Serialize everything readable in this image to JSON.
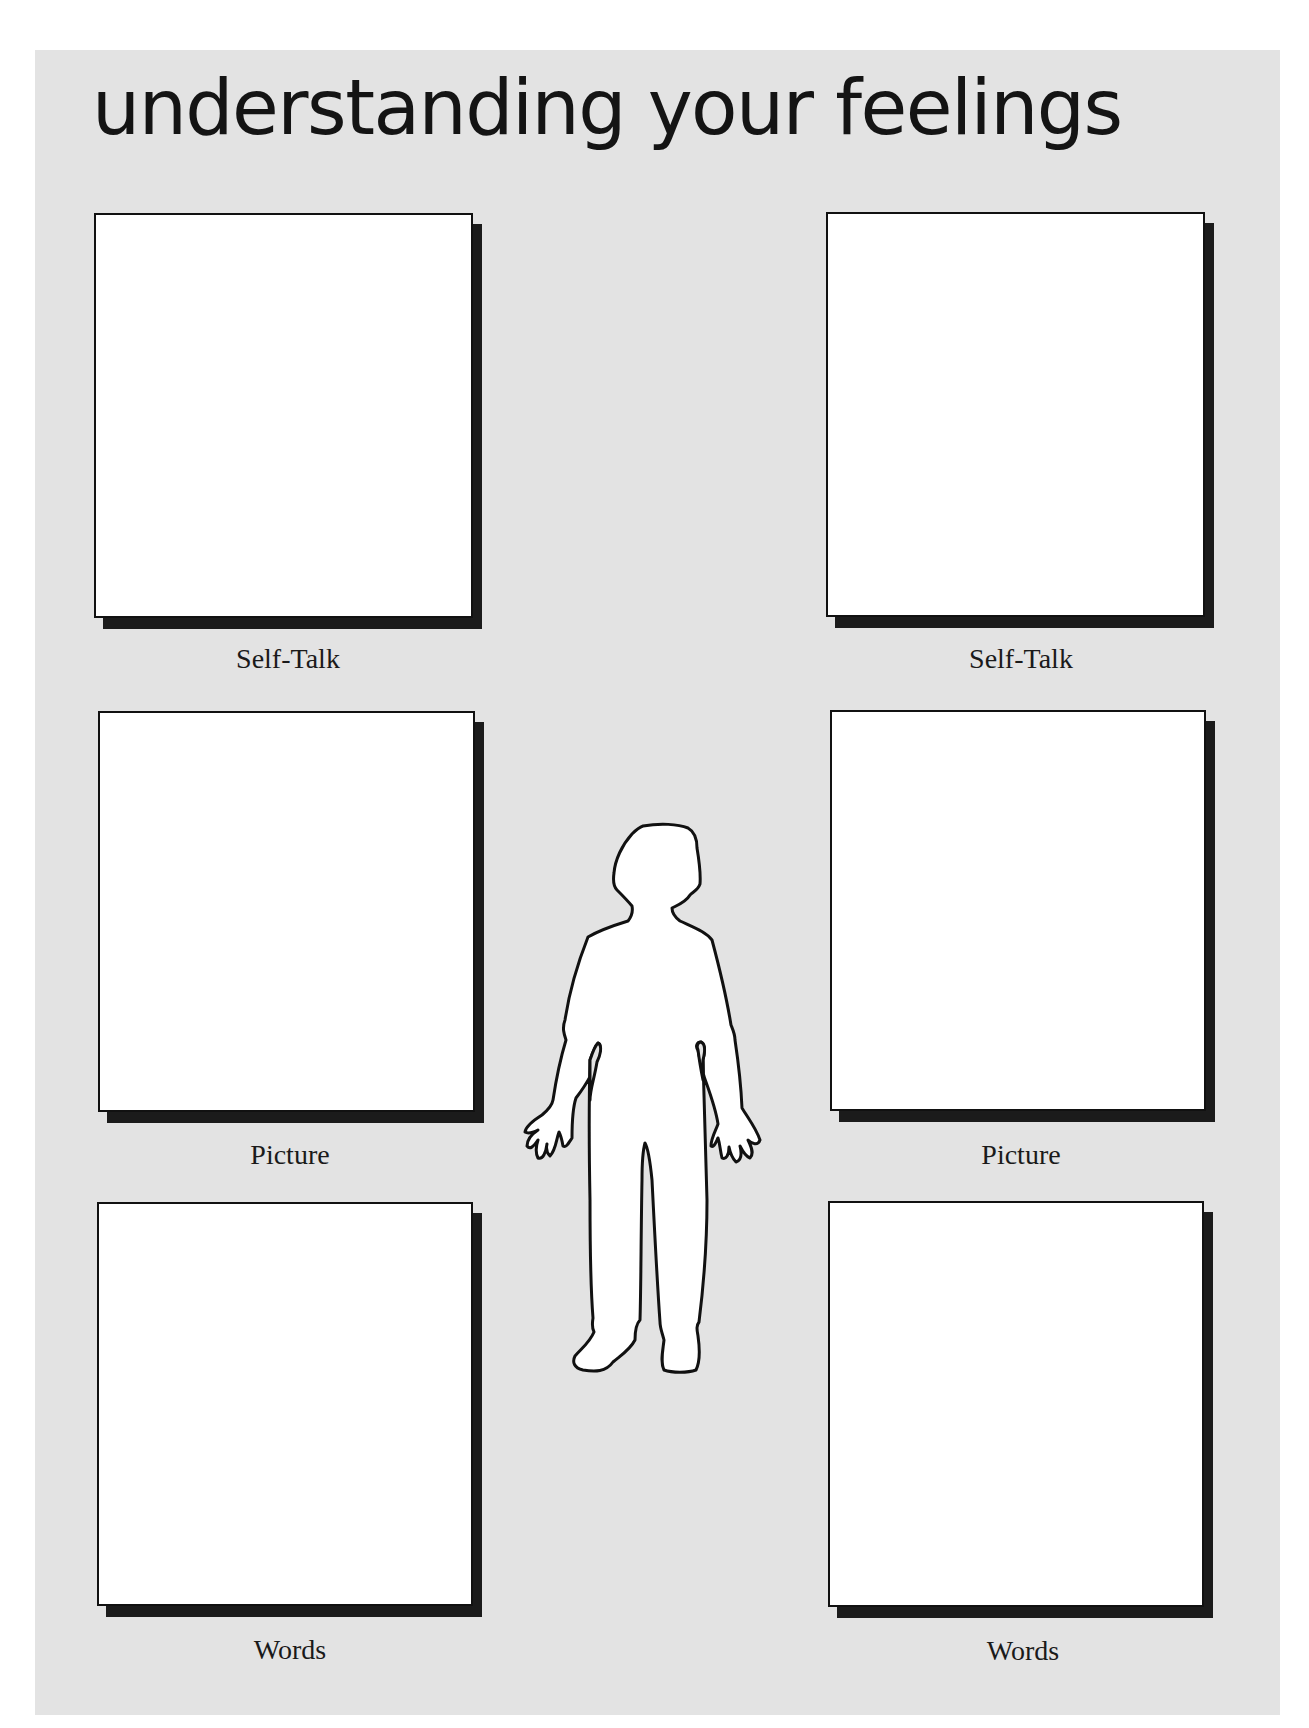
{
  "page": {
    "title": "understanding your feelings",
    "background_color": "#e3e3e3",
    "box_color": "#ffffff",
    "shadow_color": "#1b1b1b"
  },
  "left_column": {
    "boxes": [
      {
        "label": "Self-Talk"
      },
      {
        "label": "Picture"
      },
      {
        "label": "Words"
      }
    ]
  },
  "right_column": {
    "boxes": [
      {
        "label": "Self-Talk"
      },
      {
        "label": "Picture"
      },
      {
        "label": "Words"
      }
    ]
  },
  "figure": {
    "icon": "person-silhouette-icon"
  }
}
